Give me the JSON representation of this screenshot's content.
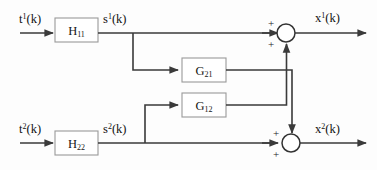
{
  "diagram": {
    "background_color": "#fdfdfd",
    "wire_color": "#3a3a3a",
    "block_border_color": "#9a9a9a",
    "text_color": "#151515",
    "blocks": [
      {
        "id": "H11",
        "base": "H",
        "subscript": "11"
      },
      {
        "id": "H22",
        "base": "H",
        "subscript": "22"
      },
      {
        "id": "G21",
        "base": "G",
        "subscript": "21"
      },
      {
        "id": "G12",
        "base": "G",
        "subscript": "12"
      }
    ],
    "signals": [
      {
        "id": "t1",
        "base": "t",
        "superscript": "1",
        "arg": "(k)"
      },
      {
        "id": "s1",
        "base": "s",
        "superscript": "1",
        "arg": "(k)"
      },
      {
        "id": "x1",
        "base": "x",
        "superscript": "1",
        "arg": "(k)"
      },
      {
        "id": "t2",
        "base": "t",
        "superscript": "2",
        "arg": "(k)"
      },
      {
        "id": "s2",
        "base": "s",
        "superscript": "2",
        "arg": "(k)"
      },
      {
        "id": "x2",
        "base": "x",
        "superscript": "2",
        "arg": "(k)"
      }
    ],
    "summers": [
      {
        "id": "sum-top",
        "sign_upper": "+",
        "sign_lower": "+"
      },
      {
        "id": "sum-bottom",
        "sign_upper": "+",
        "sign_lower": "+"
      }
    ]
  }
}
